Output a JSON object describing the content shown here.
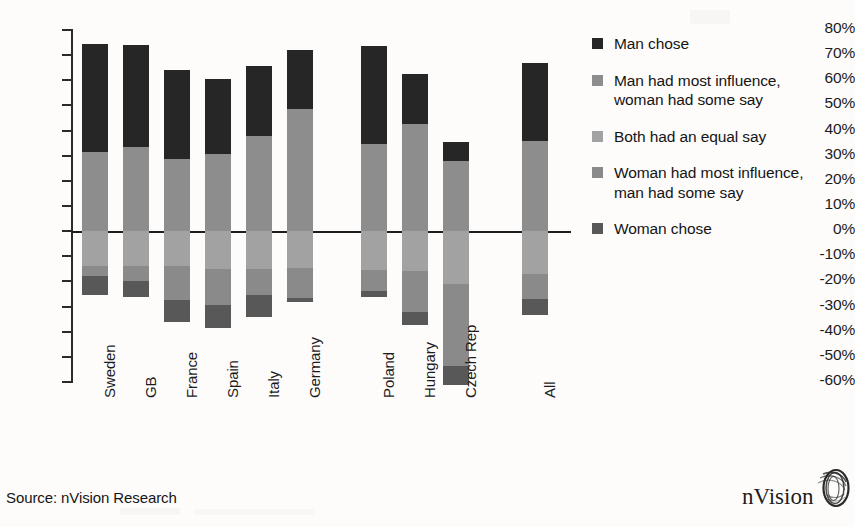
{
  "chart_data": {
    "type": "bar",
    "subtype": "diverging-stacked-bar",
    "title": "",
    "xlabel": "",
    "ylabel": "",
    "ylim": [
      -60,
      80
    ],
    "ytick_step": 10,
    "grid": false,
    "legend_position": "right",
    "categories": [
      "Sweden",
      "GB",
      "France",
      "Spain",
      "Italy",
      "Germany",
      "Poland",
      "Hungary",
      "Czech Rep",
      "All"
    ],
    "ytick_labels": [
      "80%",
      "70%",
      "60%",
      "50%",
      "40%",
      "30%",
      "20%",
      "10%",
      "0%",
      "-10%",
      "-20%",
      "-30%",
      "-40%",
      "-50%",
      "-60%"
    ],
    "series": [
      {
        "name": "Man chose",
        "color": "#262626",
        "direction": "positive",
        "values": [
          43.0,
          40.5,
          35.5,
          30.0,
          27.5,
          23.5,
          39.0,
          20.0,
          7.5,
          31.0
        ]
      },
      {
        "name": "Man had most influence, woman had some say",
        "color": "#8d8d8d",
        "direction": "positive",
        "values": [
          31.5,
          33.5,
          28.5,
          30.5,
          38.0,
          48.5,
          34.5,
          42.5,
          28.0,
          36.0
        ]
      },
      {
        "name": "Both had an equal say",
        "color": "#a2a2a2",
        "direction": "negative",
        "values": [
          14.0,
          14.0,
          14.0,
          15.0,
          15.0,
          14.5,
          15.5,
          16.0,
          21.0,
          17.0
        ]
      },
      {
        "name": "Woman had most influence, man had some say",
        "color": "#8a8a8a",
        "direction": "negative",
        "values": [
          4.0,
          6.0,
          13.5,
          14.5,
          10.5,
          12.0,
          8.5,
          16.0,
          32.5,
          10.0
        ]
      },
      {
        "name": "Woman chose",
        "color": "#585858",
        "direction": "negative",
        "values": [
          7.5,
          6.0,
          8.5,
          9.0,
          8.5,
          1.5,
          2.0,
          5.5,
          7.5,
          6.5
        ]
      }
    ],
    "positive_totals": [
      74.5,
      74.0,
      64.0,
      60.5,
      65.5,
      72.0,
      73.5,
      62.5,
      35.5,
      67.0
    ],
    "negative_totals": [
      -25.5,
      -26.0,
      -36.0,
      -38.5,
      -34.0,
      -28.0,
      -26.0,
      -37.5,
      -61.0,
      -33.5
    ]
  },
  "legend": {
    "items": [
      {
        "label": "Man chose",
        "color": "#262626"
      },
      {
        "label": "Man had most influence, woman had some say",
        "color": "#8d8d8d"
      },
      {
        "label": "Both had an equal say",
        "color": "#a2a2a2"
      },
      {
        "label": "Woman had most influence, man had some say",
        "color": "#8a8a8a"
      },
      {
        "label": "Woman chose",
        "color": "#585858"
      }
    ]
  },
  "footer": {
    "source": "Source: nVision Research"
  },
  "brand": {
    "name": "nVision",
    "mark": "eye-swirl-icon"
  }
}
